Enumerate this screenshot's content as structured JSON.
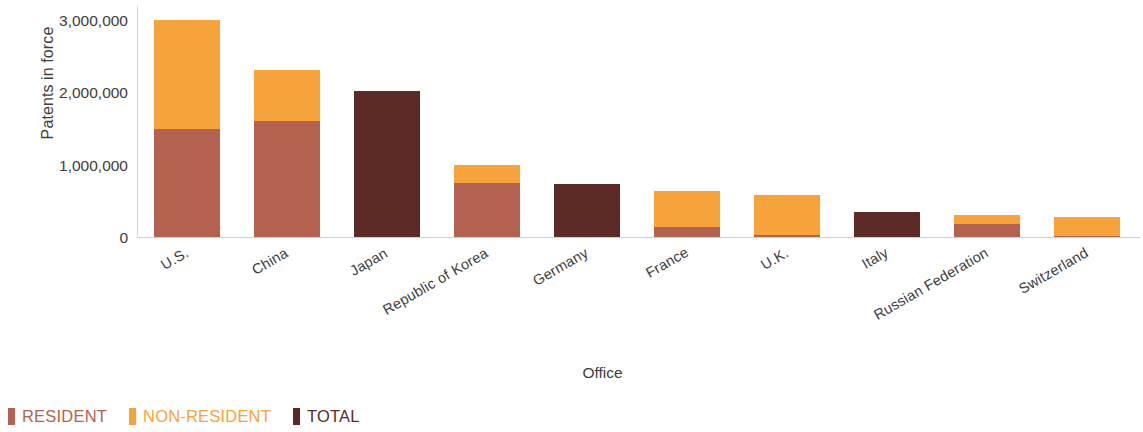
{
  "chart_data": {
    "type": "bar",
    "title": "",
    "subtitle": "",
    "stacked": true,
    "xlabel": "Office",
    "ylabel": "Patents in force",
    "ylim": [
      0,
      3200000
    ],
    "yticks": [
      0,
      1000000,
      2000000,
      3000000
    ],
    "ytick_labels": [
      "0",
      "1,000,000",
      "2,000,000",
      "3,000,000"
    ],
    "grid": false,
    "legend_position": "bottom-left",
    "categories": [
      "U.S.",
      "China",
      "Japan",
      "Republic of Korea",
      "Germany",
      "France",
      "U.K.",
      "Italy",
      "Russian Federation",
      "Switzerland"
    ],
    "series": [
      {
        "name": "RESIDENT",
        "color": "#b2624f",
        "values": [
          1490000,
          1595000,
          0,
          740000,
          0,
          135000,
          25000,
          0,
          175000,
          20000
        ]
      },
      {
        "name": "NON-RESIDENT",
        "color": "#f7a33c",
        "values": [
          1510000,
          715000,
          0,
          260000,
          0,
          500000,
          555000,
          0,
          125000,
          250000
        ]
      },
      {
        "name": "TOTAL",
        "color": "#5c2b25",
        "values": [
          0,
          0,
          2010000,
          0,
          730000,
          0,
          0,
          350000,
          0,
          0
        ]
      }
    ],
    "totals": [
      3000000,
      2310000,
      2010000,
      1000000,
      730000,
      635000,
      580000,
      350000,
      300000,
      270000
    ]
  },
  "legend": {
    "items": [
      {
        "label": "RESIDENT",
        "color": "#b2624f"
      },
      {
        "label": "NON-RESIDENT",
        "color": "#f7a33c"
      },
      {
        "label": "TOTAL",
        "color": "#5c2b25"
      }
    ]
  },
  "colors": {
    "resident": "#b2624f",
    "non_resident": "#f7a33c",
    "total": "#5c2b25",
    "axis": "#d0d0d0",
    "text": "#3d3d3d",
    "background": "#ffffff"
  }
}
